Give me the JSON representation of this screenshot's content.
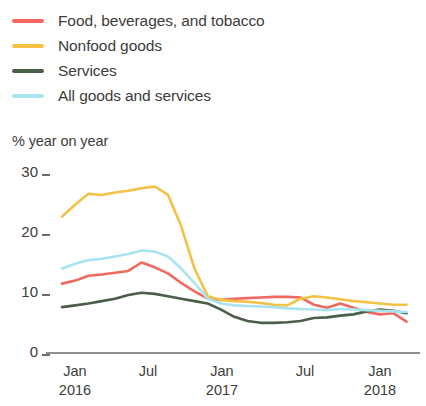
{
  "legend": {
    "position": "top-left",
    "items": [
      {
        "label": "Food, beverages, and tobacco",
        "color": "#F2685E",
        "key": "food"
      },
      {
        "label": "Nonfood goods",
        "color": "#F5C145",
        "key": "nonfood"
      },
      {
        "label": "Services",
        "color": "#4A5F47",
        "key": "services"
      },
      {
        "label": "All goods and services",
        "color": "#A8E4EF",
        "key": "all"
      }
    ]
  },
  "axis": {
    "y_title": "% year on year",
    "y_ticks": [
      "0",
      "10",
      "20",
      "30"
    ],
    "x_ticks": [
      {
        "month": "Jan",
        "year": "2016"
      },
      {
        "month": "Jul",
        "year": ""
      },
      {
        "month": "Jan",
        "year": "2017"
      },
      {
        "month": "Jul",
        "year": ""
      },
      {
        "month": "Jan",
        "year": "2018"
      }
    ]
  },
  "chart_data": {
    "type": "line",
    "title": "",
    "subtitle": "",
    "xlabel": "",
    "ylabel": "% year on year",
    "ylim": [
      0,
      30
    ],
    "yticks": [
      0,
      10,
      20,
      30
    ],
    "grid": false,
    "legend_position": "top-left",
    "x": [
      "2016-01",
      "2016-02",
      "2016-03",
      "2016-04",
      "2016-05",
      "2016-06",
      "2016-07",
      "2016-08",
      "2016-09",
      "2016-10",
      "2016-11",
      "2016-12",
      "2017-01",
      "2017-02",
      "2017-03",
      "2017-04",
      "2017-05",
      "2017-06",
      "2017-07",
      "2017-08",
      "2017-09",
      "2017-10",
      "2017-11",
      "2017-12",
      "2018-01",
      "2018-02",
      "2018-03"
    ],
    "xtick_labels": [
      "Jan 2016",
      "Jul",
      "Jan 2017",
      "Jul",
      "Jan 2018"
    ],
    "xtick_indices": [
      0,
      6,
      12,
      18,
      24
    ],
    "series": [
      {
        "name": "Food, beverages, and tobacco",
        "color": "#F2685E",
        "values": [
          11.5,
          12.0,
          12.8,
          13.0,
          13.3,
          13.6,
          15.0,
          14.2,
          13.2,
          11.6,
          10.2,
          9.0,
          8.8,
          9.0,
          9.1,
          9.2,
          9.3,
          9.3,
          9.2,
          8.0,
          7.5,
          8.2,
          7.5,
          6.8,
          6.4,
          6.6,
          5.2
        ]
      },
      {
        "name": "Nonfood goods",
        "color": "#F5C145",
        "values": [
          22.6,
          24.6,
          26.4,
          26.2,
          26.6,
          26.9,
          27.3,
          27.6,
          26.2,
          21.0,
          14.0,
          9.4,
          8.8,
          8.6,
          8.5,
          8.3,
          8.0,
          7.9,
          9.0,
          9.4,
          9.2,
          8.9,
          8.6,
          8.4,
          8.2,
          8.0,
          8.0
        ]
      },
      {
        "name": "Services",
        "color": "#4A5F47",
        "values": [
          7.6,
          7.9,
          8.2,
          8.6,
          9.0,
          9.6,
          10.0,
          9.8,
          9.4,
          9.0,
          8.6,
          8.2,
          7.2,
          6.0,
          5.3,
          5.0,
          5.0,
          5.1,
          5.3,
          5.8,
          5.9,
          6.2,
          6.4,
          6.9,
          7.2,
          7.0,
          6.6
        ]
      },
      {
        "name": "All goods and services",
        "color": "#A8E4EF",
        "values": [
          14.0,
          14.8,
          15.4,
          15.6,
          16.0,
          16.4,
          17.0,
          16.8,
          16.0,
          14.0,
          11.6,
          9.0,
          8.2,
          7.9,
          7.8,
          7.7,
          7.6,
          7.4,
          7.3,
          7.2,
          7.1,
          7.3,
          7.2,
          7.1,
          7.0,
          6.9,
          6.8
        ]
      }
    ]
  }
}
